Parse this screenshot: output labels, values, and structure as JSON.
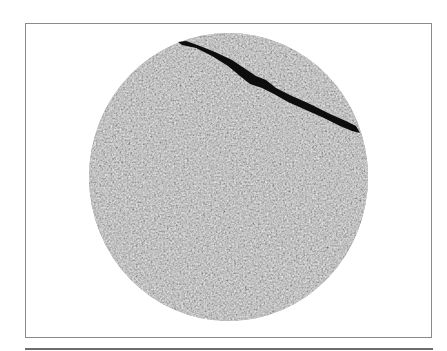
{
  "figure": {
    "colors": {
      "background": "#ffffff",
      "frame_border": "#8a8a8a",
      "specimen_gray": "#9a9a9a",
      "crack": "#0d0d0d",
      "bottom_rule": "#6e6e6e"
    }
  }
}
